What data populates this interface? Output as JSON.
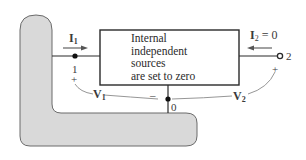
{
  "diagram": {
    "type": "two-port network schematic",
    "box": {
      "lines": [
        "Internal",
        "independent",
        "sources",
        "are set to zero"
      ]
    },
    "port1": {
      "current_label": "I",
      "current_sub": "1",
      "terminal_label": "1",
      "polarity_plus": "+",
      "voltage_label": "V",
      "voltage_sub": "1"
    },
    "port2": {
      "current_label": "I",
      "current_sub": "2",
      "current_value": " = 0",
      "terminal_label": "2",
      "polarity_plus": "+",
      "voltage_label": "V",
      "voltage_sub": "2"
    },
    "common": {
      "node_label": "0",
      "polarity_minus": "–"
    },
    "colors": {
      "wire": "#2a2a2a",
      "fill_gray": "#d9d9d9",
      "fill_border": "#6b6b6b",
      "curve": "#8a8a8a"
    }
  }
}
